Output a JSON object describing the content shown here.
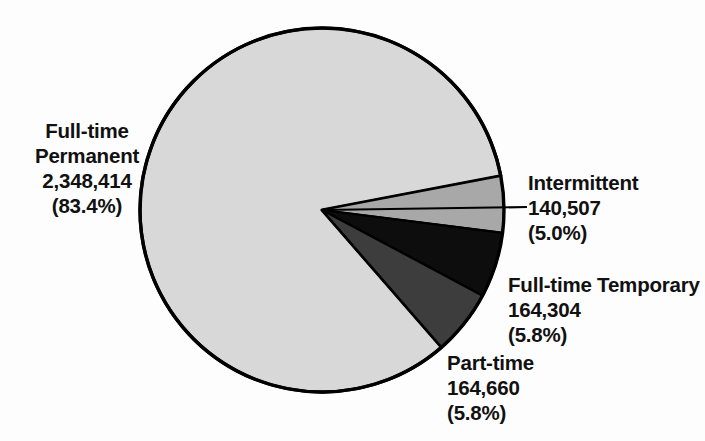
{
  "chart_data": {
    "type": "pie",
    "title": "",
    "subtitle": "",
    "xlabel": "",
    "ylabel": "",
    "legend_position": "callout-labels",
    "grid": false,
    "total": 2817885,
    "categories": [
      "Full-time Permanent",
      "Intermittent",
      "Full-time Temporary",
      "Part-time"
    ],
    "values": [
      2348414,
      140507,
      164304,
      164660
    ],
    "percentages": [
      83.4,
      5.0,
      5.8,
      5.8
    ],
    "value_labels": [
      "2,348,414",
      "140,507",
      "164,304",
      "164,660"
    ],
    "percent_labels": [
      "(83.4%)",
      "(5.0%)",
      "(5.8%)",
      "(5.8%)"
    ],
    "colors": [
      "#d8d8d8",
      "#a8a8a8",
      "#0d0d0d",
      "#3d3d3d"
    ],
    "slice_outline_color": "#000000",
    "background_color": "#fdfdfd",
    "text_color": "#111111",
    "slices": [
      {
        "name": "Full-time Permanent",
        "label_line1": "Full-time",
        "label_line2": "Permanent",
        "value_label": "2,348,414",
        "percent_label": "(83.4%)",
        "value": 2348414,
        "percent": 83.4,
        "color": "#d8d8d8"
      },
      {
        "name": "Intermittent",
        "label_line1": "Intermittent",
        "label_line2": "",
        "value_label": "140,507",
        "percent_label": "(5.0%)",
        "value": 140507,
        "percent": 5.0,
        "color": "#a8a8a8"
      },
      {
        "name": "Full-time Temporary",
        "label_line1": "Full-time Temporary",
        "label_line2": "",
        "value_label": "164,304",
        "percent_label": "(5.8%)",
        "value": 164304,
        "percent": 5.8,
        "color": "#0d0d0d"
      },
      {
        "name": "Part-time",
        "label_line1": "Part-time",
        "label_line2": "",
        "value_label": "164,660",
        "percent_label": "(5.8%)",
        "value": 164660,
        "percent": 5.8,
        "color": "#3d3d3d"
      }
    ]
  }
}
